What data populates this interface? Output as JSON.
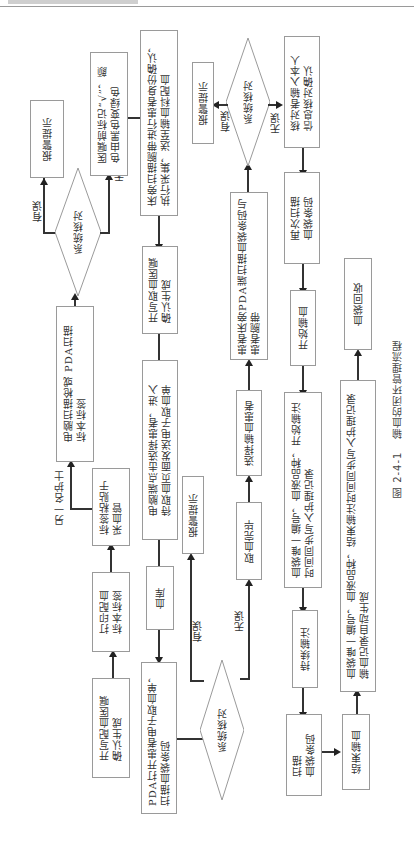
{
  "header": {
    "text": ""
  },
  "caption": {
    "number": "图 2-4-1",
    "title": "输血的闭环管理流程"
  },
  "nodes": {
    "n1": "开写配血医嘱\n确认生成",
    "n2": "打印配血\n标本标签",
    "n3": "标签粘贴于\n采血管",
    "n4": "电脑扫描枪或 PDA扫描\n标本标签",
    "d1": "系统核对",
    "n5": "报警提示",
    "n6": "医嘱前标记“√”，颜\n色由黑色变绿色",
    "n7": "床旁扫描腕带进行患者身份确认，\n执行采集，送至输血科配血",
    "n8": "开写取血医嘱\n确认生成",
    "n9": "电脑端点击选择患者，进入\n待取血页面发送电子取血单",
    "n10": "血库",
    "n11": "PDA打开患者电子取血单，\n扫描血袋条码",
    "d2": "系统核对",
    "n12": "报警提示",
    "n13": "取血完毕",
    "n14": "选择输血患者",
    "n15": "患者床旁PDA端扫描血袋条码与\n患者腕带",
    "d3": "系统核对",
    "n16": "报警提示",
    "n17": "核对者输入本人\n信息核对确认",
    "n18": "再次扫描\n血袋条码",
    "n19": "开始输血",
    "n20": "血袋唯一编号，血液品种，开始输注\n时间同步写入护理记录",
    "n21": "持续输注",
    "n22": "扫描\n血袋条码",
    "n23": "结束输血",
    "n24": "血袋唯一编号，血液品种，结束输注时间同步写入护理记录\n输血记录自动生成",
    "n25": "血袋回收"
  },
  "labels": {
    "error": "有误",
    "ok": "无误",
    "another_nurse": "另一名护士"
  },
  "colors": {
    "line": "#333333",
    "border": "#9a9a9a",
    "text": "#333333"
  }
}
